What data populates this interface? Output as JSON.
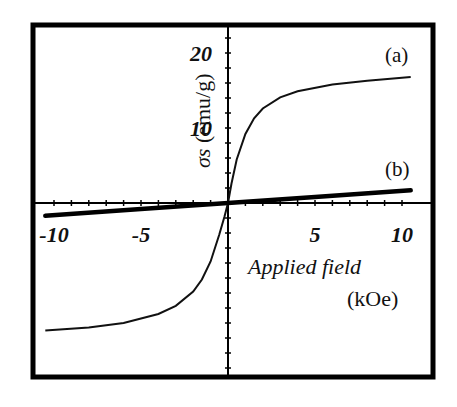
{
  "chart_data": {
    "type": "line",
    "title": "",
    "xlabel": "Applied field",
    "xlabel_unit": "(kOe)",
    "ylabel": "σs (emu/g)",
    "xlim": [
      -11,
      11
    ],
    "ylim": [
      -21,
      24
    ],
    "x_ticks": [
      -10,
      -5,
      5,
      10
    ],
    "x_tick_labels": [
      "-10",
      "-5",
      "5",
      "10"
    ],
    "y_ticks": [
      10,
      20
    ],
    "y_tick_labels": [
      "10",
      "20"
    ],
    "grid": false,
    "legend": "inline labels at right",
    "series": [
      {
        "name": "(a)",
        "x": [
          -10.5,
          -8,
          -6,
          -4,
          -3,
          -2,
          -1.5,
          -1,
          -0.5,
          -0.2,
          0,
          0.2,
          0.5,
          1,
          1.5,
          2,
          3,
          4,
          6,
          8,
          10.5
        ],
        "values": [
          -17.0,
          -16.6,
          -16.0,
          -14.8,
          -13.7,
          -11.8,
          -10.2,
          -7.8,
          -4.2,
          -1.8,
          0,
          2.6,
          5.8,
          9.2,
          11.3,
          12.6,
          14.1,
          14.9,
          15.8,
          16.3,
          16.8
        ]
      },
      {
        "name": "(b)",
        "x": [
          -10.5,
          -5,
          0,
          5,
          10.5
        ],
        "values": [
          -1.7,
          -0.8,
          0,
          0.8,
          1.7
        ]
      }
    ]
  },
  "labels": {
    "series_a": "(a)",
    "series_b": "(b)",
    "y_axis_title": "σs (emu/g)",
    "x_axis_title": "Applied field",
    "x_axis_unit": "(kOe)"
  }
}
